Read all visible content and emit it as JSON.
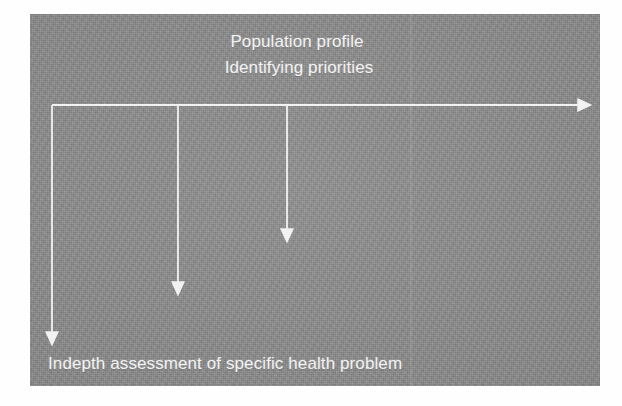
{
  "slide": {
    "background_color": "#8b8b8b",
    "line_color": "#f2f2f2",
    "title_line_1": "Population profile",
    "title_line_2": "Identifying priorities",
    "bottom_caption": "Indepth assessment of specific health problem"
  },
  "diagram": {
    "type": "timeline-with-branches",
    "main_axis": {
      "name": "horizontal-arrow",
      "x_start": 22,
      "x_end": 554,
      "y": 91
    },
    "branches": [
      {
        "name": "branch-1",
        "x": 22,
        "y_start": 91,
        "y_end": 324
      },
      {
        "name": "branch-2",
        "x": 148,
        "y_start": 91,
        "y_end": 274
      },
      {
        "name": "branch-3",
        "x": 257,
        "y_start": 91,
        "y_end": 221
      }
    ]
  }
}
